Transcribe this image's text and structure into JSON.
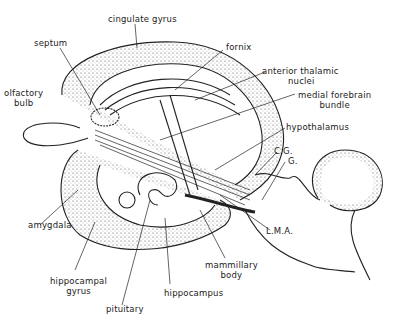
{
  "diagram": {
    "labels": {
      "cingulate_gyrus": "cingulate gyrus",
      "septum": "septum",
      "fornix": "fornix",
      "anterior_thalamic_1": "anterior thalamic",
      "anterior_thalamic_2": "nuclei",
      "olfactory_1": "olfactory",
      "olfactory_2": "bulb",
      "mfb_1": "medial forebrain",
      "mfb_2": "bundle",
      "hypothalamus": "hypothalamus",
      "cg": "C.G.",
      "g": "G.",
      "amygdala": "amygdala",
      "lma": "L.M.A.",
      "mammillary_1": "mammillary",
      "mammillary_2": "body",
      "hippocampal_1": "hippocampal",
      "hippocampal_2": "gyrus",
      "hippocampus": "hippocampus",
      "pituitary": "pituitary"
    },
    "colors": {
      "ink": "#222222",
      "background": "#ffffff"
    }
  }
}
